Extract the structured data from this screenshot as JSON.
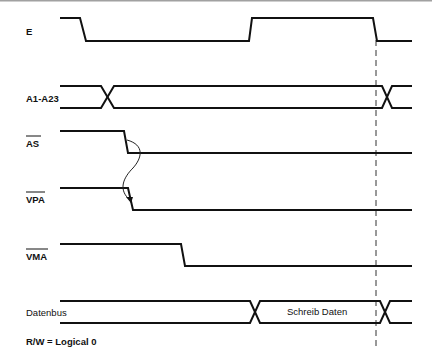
{
  "diagram": {
    "type": "timing-diagram",
    "signals": [
      {
        "name": "E",
        "overbar": false,
        "kind": "clock",
        "transitions": [
          "high->low",
          "low->high",
          "high->low"
        ]
      },
      {
        "name": "A1-A23",
        "overbar": false,
        "kind": "bus",
        "transitions": [
          "change",
          "change"
        ]
      },
      {
        "name": "AS",
        "overbar": true,
        "kind": "line",
        "transitions": [
          "high->low"
        ]
      },
      {
        "name": "VPA",
        "overbar": true,
        "kind": "line",
        "transitions": [
          "high->low"
        ]
      },
      {
        "name": "VMA",
        "overbar": true,
        "kind": "line",
        "transitions": [
          "high->low"
        ]
      },
      {
        "name": "Datenbus",
        "overbar": false,
        "kind": "bus",
        "transitions": [
          "change",
          "change"
        ],
        "data_label": "Schreib Daten"
      }
    ],
    "causal_arrow": {
      "from": "AS",
      "to": "VPA"
    },
    "reference_line": "dashed vertical at falling edge of E",
    "footnote": "R/W = Logical 0"
  }
}
